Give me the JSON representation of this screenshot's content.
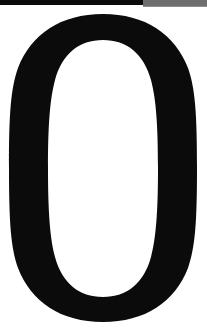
{
  "page": {
    "kind": "scanned-page-fragment",
    "background_color": "#ffffff",
    "width_px": "207",
    "height_px": "335"
  },
  "scan_edge_bar": {
    "name": "top-scan-edge-bar",
    "black_segment": {
      "label": "",
      "color": "#0a0a0a",
      "start_x_px": "0",
      "end_x_px": "143",
      "height_px": "5"
    },
    "gray_segment": {
      "label": "",
      "color": "#6e6e6e",
      "start_x_px": "143",
      "end_x_px": "207",
      "height_px": "7"
    }
  },
  "glyph": {
    "character": "0",
    "reading": "zero",
    "description": "large serif numeral zero",
    "color": "#0b0b0b",
    "counter_color": "#ffffff",
    "bounds": {
      "left_px": "9",
      "right_px": "197",
      "top_px": "14",
      "bottom_px": "322"
    },
    "counter_bounds": {
      "left_px": "48",
      "right_px": "158",
      "top_px": "40",
      "bottom_px": "297"
    },
    "stroke": {
      "side_width_px": "41",
      "top_width_px": "26",
      "bottom_width_px": "25"
    }
  }
}
